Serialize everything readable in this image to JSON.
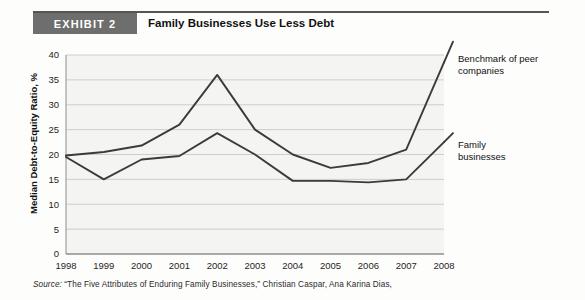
{
  "header": {
    "exhibit_badge": "EXHIBIT 2",
    "title": "Family Businesses Use Less Debt"
  },
  "footnote": {
    "source_label": "Source:",
    "source_text": " “The Five Attributes of Enduring Family Businesses,” Christian Caspar, Ana Karina Dias,"
  },
  "annotations": {
    "benchmark_line1": "Benchmark of peer",
    "benchmark_line2": "companies",
    "family_line1": "Family",
    "family_line2": "businesses"
  },
  "colors": {
    "badge_bg": "#6e6e6e",
    "line": "#3b3b3b",
    "grid": "#c9c9c9",
    "plot_bg": "#f4f4f2"
  },
  "chart_data": {
    "type": "line",
    "title": "Family Businesses Use Less Debt",
    "xlabel": "",
    "ylabel": "Median Debt-to-Equity Ratio, %",
    "x": [
      1998,
      1999,
      2000,
      2001,
      2002,
      2003,
      2004,
      2005,
      2006,
      2007,
      2008
    ],
    "xticklabels": [
      "1998",
      "1999",
      "2000",
      "2001",
      "2002",
      "2003",
      "2004",
      "2005",
      "2006",
      "2007",
      "2008"
    ],
    "yticks": [
      0,
      5,
      10,
      15,
      20,
      25,
      30,
      35,
      40
    ],
    "yticklabels": [
      "0",
      "5",
      "10",
      "15",
      "20",
      "25",
      "30",
      "35",
      "40"
    ],
    "ylim": [
      0,
      40
    ],
    "xlim": [
      1998,
      2008
    ],
    "grid": "horizontal",
    "legend_position": "right-annotations",
    "series": [
      {
        "name": "Benchmark of peer companies",
        "values": [
          19.8,
          20.5,
          21.8,
          26.0,
          36.0,
          25.0,
          20.0,
          17.3,
          18.3,
          21.0,
          38.5
        ]
      },
      {
        "name": "Family businesses",
        "values": [
          19.5,
          15.0,
          19.0,
          19.7,
          24.3,
          20.0,
          14.7,
          14.7,
          14.4,
          15.0,
          22.5
        ]
      }
    ]
  }
}
